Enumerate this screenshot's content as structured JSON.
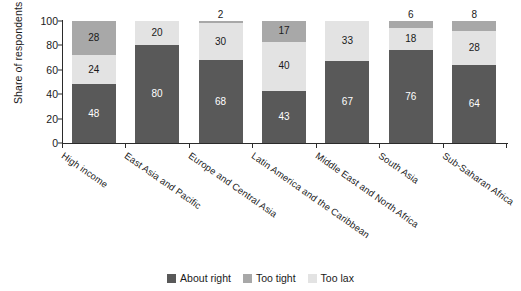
{
  "chart_data": {
    "type": "bar",
    "subtype": "stacked-bar-100",
    "title": "",
    "xlabel": "",
    "ylabel": "Share of respondents (%)",
    "ylim": [
      0,
      100
    ],
    "yticks": [
      0,
      20,
      40,
      60,
      80,
      100
    ],
    "grid": false,
    "legend_position": "bottom-center",
    "stack_order_bottom_to_top": [
      "About right",
      "Too lax",
      "Too tight"
    ],
    "categories": [
      "High income",
      "East Asia and Pacific",
      "Europe and Central Asia",
      "Latin America and the Caribbean",
      "Middle East and North Africa",
      "South Asia",
      "Sub-Saharan Africa"
    ],
    "series": [
      {
        "name": "About right",
        "color": "#595959",
        "values": [
          48,
          80,
          68,
          43,
          67,
          76,
          64
        ]
      },
      {
        "name": "Too lax",
        "color": "#e3e3e3",
        "values": [
          24,
          20,
          30,
          40,
          33,
          18,
          28
        ]
      },
      {
        "name": "Too tight",
        "color": "#a8a8a8",
        "values": [
          28,
          0,
          2,
          17,
          0,
          6,
          8
        ]
      }
    ]
  },
  "axis": {
    "y_title": "Share of respondents (%)",
    "y_tick_labels": [
      "0",
      "20",
      "40",
      "60",
      "80",
      "100"
    ]
  },
  "legend": {
    "items": [
      {
        "label": "About right",
        "color": "#595959"
      },
      {
        "label": "Too tight",
        "color": "#a8a8a8"
      },
      {
        "label": "Too lax",
        "color": "#e3e3e3"
      }
    ]
  }
}
